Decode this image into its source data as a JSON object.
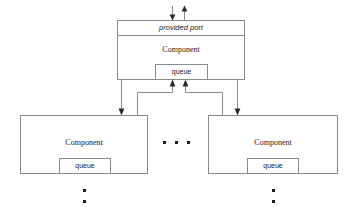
{
  "diagram": {
    "colors": {
      "background": "#ffffff",
      "line": "#8a8a8a",
      "arrow": "#2b2b2b",
      "text": "#1a1a1a"
    },
    "top_component": {
      "port_label": "provided port",
      "name_label": "Component",
      "queue_label": "queue"
    },
    "left_component": {
      "name_label": "Component",
      "queue_label": "queue"
    },
    "right_component": {
      "name_label": "Component",
      "queue_label": "queue"
    },
    "ellipsis": {
      "horizontal_label": "• • •",
      "left_vertical_label": "•",
      "right_vertical_label": "•"
    }
  }
}
